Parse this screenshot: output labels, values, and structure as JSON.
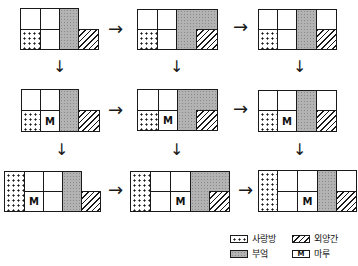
{
  "figure": {
    "type": "floor-plan-evolution",
    "rows": 3,
    "cols": 3
  },
  "legend": {
    "sarangbang": {
      "label": "사랑방",
      "pattern": "dots"
    },
    "kitchen": {
      "label": "부엌",
      "pattern": "gray"
    },
    "stable": {
      "label": "외양간",
      "pattern": "hatch"
    },
    "maru": {
      "label": "마루",
      "symbol": "M"
    }
  },
  "maru_symbol": "M",
  "arrows": {
    "right": "→",
    "down": "↓"
  },
  "plans": [
    {
      "id": 1,
      "row": 1,
      "col": 1
    },
    {
      "id": 2,
      "row": 1,
      "col": 2
    },
    {
      "id": 3,
      "row": 1,
      "col": 3
    },
    {
      "id": 4,
      "row": 2,
      "col": 1
    },
    {
      "id": 5,
      "row": 2,
      "col": 2
    },
    {
      "id": 6,
      "row": 2,
      "col": 3
    },
    {
      "id": 7,
      "row": 3,
      "col": 1
    },
    {
      "id": 8,
      "row": 3,
      "col": 2
    },
    {
      "id": 9,
      "row": 3,
      "col": 3
    }
  ]
}
